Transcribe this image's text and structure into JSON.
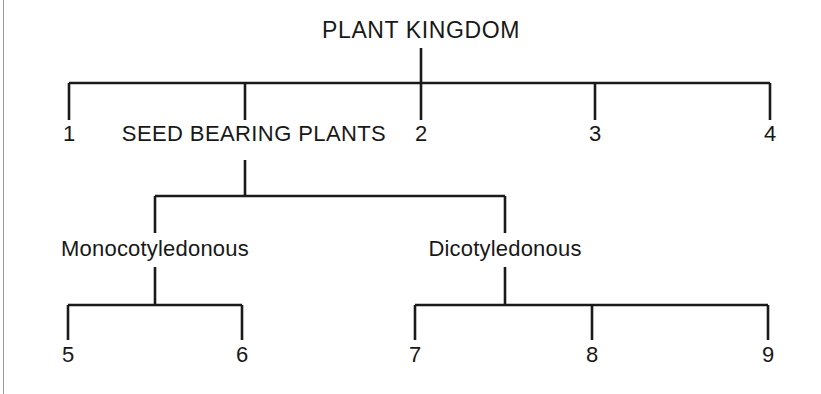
{
  "diagram": {
    "type": "hierarchical-tree",
    "title": "PLANT KINGDOM",
    "line_color": "#1a1a1a",
    "background_color": "#ffffff",
    "levels": [
      {
        "level": 1,
        "parent": "PLANT KINGDOM",
        "children": [
          "1",
          "SEED BEARING PLANTS",
          "2",
          "3",
          "4"
        ]
      },
      {
        "level": 2,
        "parent": "SEED BEARING PLANTS",
        "children": [
          "Monocotyledonous",
          "Dicotyledonous"
        ]
      },
      {
        "level": 3,
        "parent": "Monocotyledonous",
        "children": [
          "5",
          "6"
        ]
      },
      {
        "level": 3,
        "parent": "Dicotyledonous",
        "children": [
          "7",
          "8",
          "9"
        ]
      }
    ],
    "nodes": {
      "root": "PLANT KINGDOM",
      "seed_bearing": "SEED BEARING PLANTS",
      "monocot": "Monocotyledonous",
      "dicot": "Dicotyledonous"
    },
    "leaf_numbers": {
      "n1": "1",
      "n2": "2",
      "n3": "3",
      "n4": "4",
      "n5": "5",
      "n6": "6",
      "n7": "7",
      "n8": "8",
      "n9": "9"
    }
  }
}
